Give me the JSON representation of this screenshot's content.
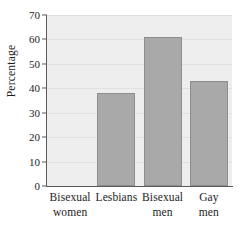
{
  "chart_data": {
    "type": "bar",
    "title": "",
    "subtitle": "",
    "xlabel": "",
    "ylabel": "Percentage",
    "ylim": [
      0,
      70
    ],
    "yticks": [
      0,
      10,
      20,
      30,
      40,
      50,
      60,
      70
    ],
    "ytick_labels": [
      "0",
      "10",
      "20",
      "30",
      "40",
      "50",
      "60",
      "70"
    ],
    "grid": true,
    "legend": false,
    "legend_position": "none",
    "categories": [
      "Bisexual women",
      "Lesbians",
      "Bisexual men",
      "Gay men"
    ],
    "category_lines": [
      {
        "line1": "Bisexual",
        "line2": "women"
      },
      {
        "line1": "Lesbians",
        "line2": ""
      },
      {
        "line1": "Bisexual",
        "line2": "men"
      },
      {
        "line1": "Gay",
        "line2": "men"
      }
    ],
    "values": [
      0,
      38,
      61,
      43
    ],
    "annotations": []
  },
  "style": {
    "bar_fill": "#a9a9a9",
    "bar_border": "#8d8d8d",
    "plot_background": "#eeeeee",
    "gridline_color": "#e0e0e0",
    "axis_color": "#5a5a5a",
    "text_color": "#1c1c1c",
    "figure_background": "#ffffff"
  }
}
